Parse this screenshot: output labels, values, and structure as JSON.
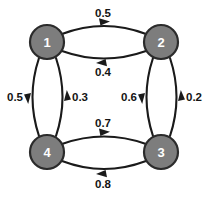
{
  "diagram": {
    "background_color": "#ffffff",
    "node_fill_color": "#7d7d7d",
    "node_stroke_color": "#2b2b2b",
    "node_label_color": "#ffffff",
    "edge_color": "#1a1a1a",
    "weight_label_color": "#141414"
  },
  "nodes": [
    {
      "id": "1",
      "label": "1",
      "x": 47,
      "y": 42,
      "r": 17
    },
    {
      "id": "2",
      "label": "2",
      "x": 161,
      "y": 42,
      "r": 17
    },
    {
      "id": "3",
      "label": "3",
      "x": 161,
      "y": 152,
      "r": 17
    },
    {
      "id": "4",
      "label": "4",
      "x": 47,
      "y": 152,
      "r": 17
    }
  ],
  "edges": [
    {
      "from": "1",
      "to": "2",
      "weight": "0.5",
      "arrow": "right",
      "label_x": 103,
      "label_y": 13
    },
    {
      "from": "2",
      "to": "1",
      "weight": "0.4",
      "arrow": "left",
      "label_x": 103,
      "label_y": 72
    },
    {
      "from": "1",
      "to": "4",
      "weight": "0.5",
      "arrow": "down",
      "label_x": 17,
      "label_y": 97
    },
    {
      "from": "4",
      "to": "1",
      "weight": "0.3",
      "arrow": "up",
      "label_x": 78,
      "label_y": 97
    },
    {
      "from": "2",
      "to": "3",
      "weight": "0.6",
      "arrow": "down",
      "label_x": 131,
      "label_y": 97
    },
    {
      "from": "3",
      "to": "2",
      "weight": "0.2",
      "arrow": "up",
      "label_x": 192,
      "label_y": 97
    },
    {
      "from": "4",
      "to": "3",
      "weight": "0.7",
      "arrow": "right",
      "label_x": 103,
      "label_y": 123
    },
    {
      "from": "3",
      "to": "4",
      "weight": "0.8",
      "arrow": "left",
      "label_x": 103,
      "label_y": 183
    }
  ]
}
